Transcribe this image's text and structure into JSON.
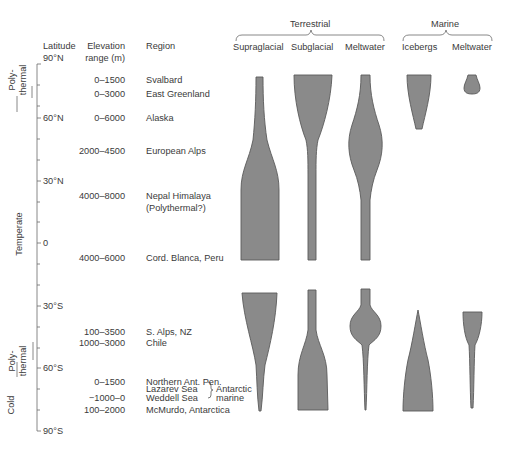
{
  "headers": {
    "latitude": "Latitude",
    "elevation_line1": "Elevation",
    "elevation_line2": "range (m)",
    "region": "Region",
    "group_terrestrial": "Terrestrial",
    "group_marine": "Marine",
    "col_supraglacial": "Supraglacial",
    "col_subglacial": "Subglacial",
    "col_terrestrial_meltwater": "Meltwater",
    "col_icebergs": "Icebergs",
    "col_marine_meltwater": "Meltwater"
  },
  "latitude_ticks": [
    "90°N",
    "60°N",
    "30°N",
    "0",
    "30°S",
    "60°S",
    "90°S"
  ],
  "thermal_zones": {
    "polythermal_north": "Poly-thermal",
    "polythermal_north_l1": "Poly-",
    "polythermal_north_l2": "thermal",
    "temperate": "Temperate",
    "polythermal_south_l1": "Poly-",
    "polythermal_south_l2": "thermal",
    "cold": "Cold"
  },
  "rows": [
    {
      "elevation": "0–1500",
      "region": "Svalbard"
    },
    {
      "elevation": "0–3000",
      "region": "East Greenland"
    },
    {
      "elevation": "0–6000",
      "region": "Alaska"
    },
    {
      "elevation": "2000–4500",
      "region": "European Alps"
    },
    {
      "elevation": "4000–8000",
      "region": "Nepal Himalaya",
      "region_note": "(Polythermal?)"
    },
    {
      "elevation": "4000–6000",
      "region": "Cord. Blanca, Peru"
    },
    {
      "elevation": "100–3500",
      "region": "S. Alps, NZ"
    },
    {
      "elevation": "1000–3000",
      "region": "Chile"
    },
    {
      "elevation": "0–1500",
      "region": "Northern Ant. Pen."
    },
    {
      "elevation": "−1000–0",
      "region": "Lazarev Sea"
    },
    {
      "elevation": "",
      "region": "Weddell Sea"
    },
    {
      "elevation": "100–2000",
      "region": "McMurdo, Antarctica"
    }
  ],
  "antarctic_marine_line1": "Antarctic",
  "antarctic_marine_line2": "marine",
  "colors": {
    "shape_fill": "#8a8a8a",
    "shape_stroke": "#5a5a5a",
    "text": "#3a3a3a",
    "axis": "#6a6a6a"
  }
}
